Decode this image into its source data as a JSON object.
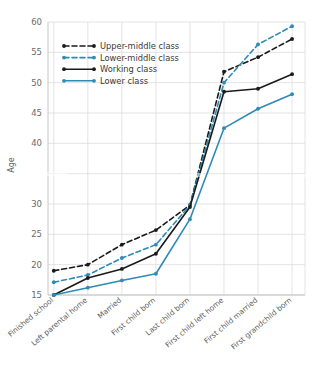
{
  "chart_data": {
    "type": "line",
    "title": "",
    "xlabel": "",
    "ylabel": "Age",
    "ylim": [
      15,
      60
    ],
    "yticks": [
      15,
      20,
      25,
      30,
      35,
      40,
      45,
      50,
      55,
      60
    ],
    "ytick_labels": [
      "15",
      "20",
      "25",
      "30",
      "",
      "40",
      "45",
      "50",
      "55",
      "60"
    ],
    "grid": true,
    "legend_position": "upper left",
    "categories": [
      "Finished school",
      "Left parental home",
      "Married",
      "First child born",
      "Last child born",
      "First child left home",
      "First child married",
      "First grandchild born"
    ],
    "series": [
      {
        "name": "Upper-middle class",
        "color": "#1a1a1a",
        "style": "dashed",
        "values": [
          19.0,
          20.0,
          23.3,
          25.7,
          29.8,
          51.8,
          54.2,
          57.2
        ]
      },
      {
        "name": "Lower-middle class",
        "color": "#2e8bb5",
        "style": "dashed",
        "values": [
          17.1,
          18.3,
          21.1,
          23.3,
          29.8,
          50.0,
          56.3,
          59.3
        ]
      },
      {
        "name": "Working class",
        "color": "#1a1a1a",
        "style": "solid",
        "values": [
          15.0,
          17.8,
          19.3,
          21.8,
          29.5,
          48.5,
          49.0,
          51.4
        ]
      },
      {
        "name": "Lower class",
        "color": "#2e8bb5",
        "style": "solid",
        "values": [
          15.0,
          16.2,
          17.4,
          18.5,
          27.5,
          42.5,
          45.7,
          48.1
        ]
      }
    ]
  },
  "legend": {
    "items": [
      "Upper-middle class",
      "Lower-middle class",
      "Working class",
      "Lower class"
    ]
  },
  "axes": {
    "y_title": "Age"
  },
  "colors": {
    "blue": "#2e8bb5",
    "black": "#1a1a1a",
    "grid": "#d8d8d8",
    "text": "#5d5d5d"
  }
}
